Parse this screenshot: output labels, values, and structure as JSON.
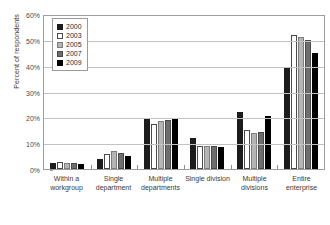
{
  "chart_data": {
    "type": "bar",
    "title": "",
    "xlabel": "",
    "ylabel": "Percent of respondents",
    "ylim": [
      0,
      60
    ],
    "ytick_labels": [
      "0%",
      "10%",
      "20%",
      "30%",
      "40%",
      "50%",
      "60%"
    ],
    "ytick_values": [
      0,
      10,
      20,
      30,
      40,
      50,
      60
    ],
    "grid": "horizontal",
    "legend_position": "top-left-inside",
    "categories": [
      "Within a workgroup",
      "Single department",
      "Multiple departments",
      "Single division",
      "Multiple divisions",
      "Entire enterprise"
    ],
    "series": [
      {
        "name": "2000",
        "color": "#1c1c1c",
        "values": [
          2.5,
          4.0,
          19.5,
          12.0,
          22.0,
          39.0
        ]
      },
      {
        "name": "2003",
        "color": "#ffffff",
        "values": [
          2.8,
          6.0,
          17.5,
          8.8,
          15.0,
          52.0
        ]
      },
      {
        "name": "2005",
        "color": "#b5b5b5",
        "values": [
          2.4,
          7.0,
          18.5,
          9.0,
          14.0,
          51.0
        ]
      },
      {
        "name": "2007",
        "color": "#6e6e6e",
        "values": [
          2.2,
          6.2,
          18.8,
          8.8,
          14.5,
          50.0
        ]
      },
      {
        "name": "2009",
        "color": "#000000",
        "values": [
          2.0,
          5.0,
          19.5,
          8.4,
          20.5,
          45.0
        ]
      }
    ]
  },
  "legend": {
    "entries": [
      {
        "label": "2000"
      },
      {
        "label": "2003"
      },
      {
        "label": "2005"
      },
      {
        "label": "2007"
      },
      {
        "label": "2009"
      }
    ]
  }
}
